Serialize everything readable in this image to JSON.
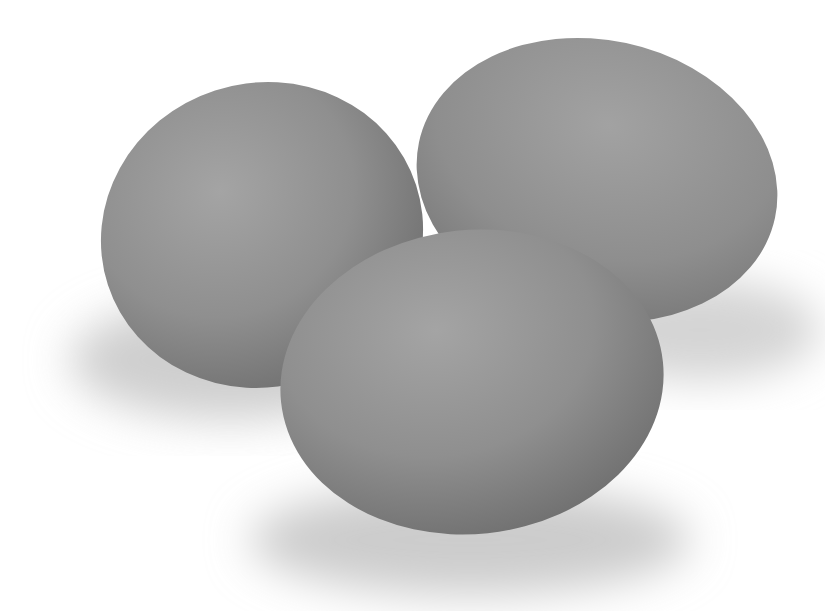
{
  "image": {
    "subject": "three grey eggs",
    "background_color": "#ffffff",
    "egg_color": "#8f8f8f",
    "egg_highlight": "#a6a6a6",
    "egg_shadow": "#6e6e6e",
    "cast_shadow": "#d9d9d9"
  }
}
